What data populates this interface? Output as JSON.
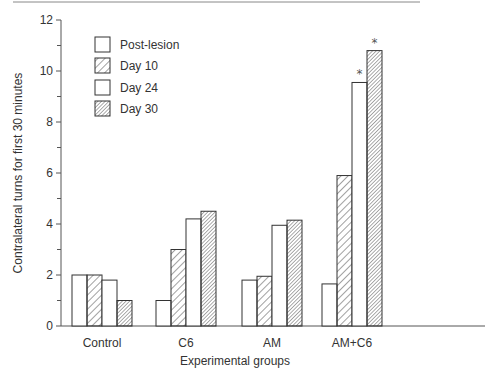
{
  "chart_data": {
    "type": "bar",
    "title": "",
    "xlabel": "Experimental groups",
    "ylabel": "Contralateral turns for first 30 minutes",
    "ylim": [
      0,
      12
    ],
    "yticks_major": [
      0,
      2,
      4,
      6,
      8,
      10,
      12
    ],
    "yticks_minor": [
      1,
      3,
      5,
      7,
      9,
      11
    ],
    "grid": false,
    "legend_position": "upper-left",
    "categories": [
      "Control",
      "C6",
      "AM",
      "AM+C6"
    ],
    "series": [
      {
        "name": "Post-lesion",
        "pattern": "none",
        "values": [
          2.0,
          1.0,
          1.8,
          1.65
        ]
      },
      {
        "name": "Day 10",
        "pattern": "sparse-diagonal",
        "values": [
          2.0,
          3.0,
          1.95,
          5.9
        ]
      },
      {
        "name": "Day 24",
        "pattern": "none",
        "values": [
          1.8,
          4.2,
          3.95,
          9.55
        ]
      },
      {
        "name": "Day 30",
        "pattern": "dense-diagonal",
        "values": [
          1.0,
          4.5,
          4.15,
          10.8
        ]
      }
    ],
    "annotations": [
      {
        "text": "*",
        "category": "AM+C6",
        "series": "Day 24"
      },
      {
        "text": "*",
        "category": "AM+C6",
        "series": "Day 30"
      }
    ]
  },
  "colors": {
    "ink": "#333333",
    "background": "#ffffff",
    "rule": "#888888"
  }
}
